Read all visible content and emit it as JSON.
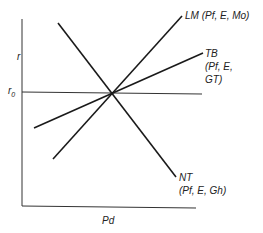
{
  "diagram": {
    "type": "economic-curve-diagram",
    "axes": {
      "y_label": "r",
      "x_label": "Pd",
      "reference_label": "r0",
      "reference_sub": "0"
    },
    "curves": [
      {
        "id": "LM",
        "label": "LM (Pf, E, Mo)"
      },
      {
        "id": "TB",
        "label_lines": [
          "TB",
          "(Pf, E,",
          "GT)"
        ]
      },
      {
        "id": "NT",
        "label_lines": [
          "NT",
          "(Pf, E, Gh)"
        ]
      }
    ],
    "r0_main": "r"
  }
}
